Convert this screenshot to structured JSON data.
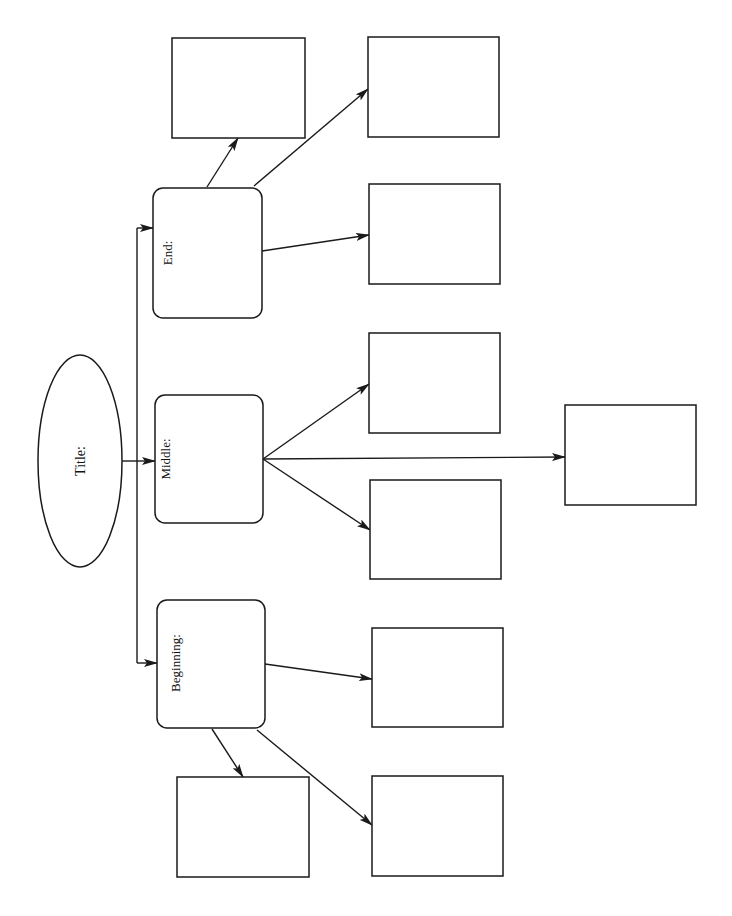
{
  "diagram": {
    "type": "story map / plot organizer",
    "orientation": "rotated 90deg counter-clockwise",
    "colors": {
      "stroke": "#1a1a1a",
      "background": "#ffffff",
      "text": "#111111"
    },
    "title_node": {
      "label": "Title:",
      "shape": "ellipse",
      "cx": 80,
      "cy": 461,
      "rx": 42,
      "ry": 106
    },
    "spine": {
      "x": 137,
      "y_top": 228,
      "y_bottom": 663
    },
    "sections": [
      {
        "id": "end",
        "label": "End:",
        "box": {
          "x": 153,
          "y": 188,
          "w": 109,
          "h": 130
        },
        "label_pos": {
          "x": 172,
          "y": 253
        },
        "entry_y": 228,
        "children": [
          {
            "id": "end-detail-1",
            "text": "",
            "box": {
              "x": 172,
              "y": 38,
              "w": 133,
              "h": 100
            },
            "from": [
              207,
              187
            ],
            "to": [
              238,
              138
            ]
          },
          {
            "id": "end-detail-2",
            "text": "",
            "box": {
              "x": 368,
              "y": 37,
              "w": 131,
              "h": 100
            },
            "from": [
              254,
              186
            ],
            "to": [
              368,
              89
            ]
          },
          {
            "id": "end-detail-3",
            "text": "",
            "box": {
              "x": 369,
              "y": 184,
              "w": 131,
              "h": 100
            },
            "from": [
              262,
              251
            ],
            "to": [
              369,
              235
            ]
          }
        ]
      },
      {
        "id": "middle",
        "label": "Middle:",
        "box": {
          "x": 155,
          "y": 395,
          "w": 108,
          "h": 128
        },
        "label_pos": {
          "x": 170,
          "y": 459
        },
        "entry_y": 461,
        "children": [
          {
            "id": "middle-detail-1",
            "text": "",
            "box": {
              "x": 369,
              "y": 333,
              "w": 131,
              "h": 100
            },
            "from": [
              263,
              459
            ],
            "to": [
              369,
              384
            ]
          },
          {
            "id": "middle-detail-2",
            "text": "",
            "box": {
              "x": 565,
              "y": 405,
              "w": 131,
              "h": 100
            },
            "from": [
              263,
              459
            ],
            "to": [
              565,
              457
            ]
          },
          {
            "id": "middle-detail-3",
            "text": "",
            "box": {
              "x": 370,
              "y": 480,
              "w": 131,
              "h": 99
            },
            "from": [
              263,
              459
            ],
            "to": [
              370,
              530
            ]
          }
        ]
      },
      {
        "id": "beginning",
        "label": "Beginning:",
        "box": {
          "x": 157,
          "y": 600,
          "w": 108,
          "h": 128
        },
        "label_pos": {
          "x": 180,
          "y": 663
        },
        "entry_y": 663,
        "children": [
          {
            "id": "beginning-detail-1",
            "text": "",
            "box": {
              "x": 372,
              "y": 628,
              "w": 131,
              "h": 99
            },
            "from": [
              265,
              664
            ],
            "to": [
              372,
              679
            ]
          },
          {
            "id": "beginning-detail-2",
            "text": "",
            "box": {
              "x": 177,
              "y": 777,
              "w": 132,
              "h": 100
            },
            "from": [
              212,
              729
            ],
            "to": [
              243,
              777
            ]
          },
          {
            "id": "beginning-detail-3",
            "text": "",
            "box": {
              "x": 372,
              "y": 776,
              "w": 131,
              "h": 100
            },
            "from": [
              257,
              730
            ],
            "to": [
              372,
              825
            ]
          }
        ]
      }
    ]
  }
}
